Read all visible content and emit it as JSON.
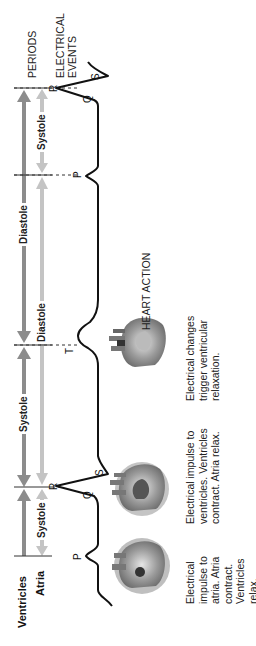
{
  "rows": {
    "ventricles_label": "Ventricles",
    "atria_label": "Atria"
  },
  "headers": {
    "periods": "PERIODS",
    "electrical_events_line1": "ELECTRICAL",
    "electrical_events_line2": "EVENTS",
    "heart_action": "HEART ACTION"
  },
  "periods": {
    "ventricles": [
      {
        "label": "Systole"
      },
      {
        "label": "Diastole"
      }
    ],
    "atria": [
      {
        "label": "Systole"
      },
      {
        "label": "Diastole"
      },
      {
        "label": "Systole"
      }
    ]
  },
  "ecg_waves": {
    "p1": "P",
    "q1": "Q",
    "r1": "R",
    "s1": "S",
    "t1": "T",
    "p2": "P",
    "q2": "Q",
    "r2": "R",
    "s2": "S"
  },
  "captions": [
    {
      "text": "Electrical impulse to atria. Atria contract. Ventricles relax."
    },
    {
      "text": "Electrical impulse to ventricles. Ventricles contract. Atria relax."
    },
    {
      "text": "Electrical changes trigger ventricular relaxation."
    }
  ],
  "colors": {
    "ventricle_arrow": "#8c8c8c",
    "atria_arrow": "#c4c4c4",
    "ecg_line": "#111111",
    "heart_tone": "#7a7a7a"
  }
}
